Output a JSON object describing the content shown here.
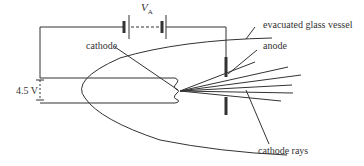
{
  "diagram": {
    "labels": {
      "va_symbol": "V",
      "va_subscript": "A",
      "cathode": "cathode",
      "evacuated_glass_vessel": "evacuated glass vessel",
      "anode": "anode",
      "heater_voltage": "4.5 V",
      "cathode_rays": "cathode rays"
    },
    "colors": {
      "line": "#333333",
      "background": "#ffffff"
    }
  }
}
